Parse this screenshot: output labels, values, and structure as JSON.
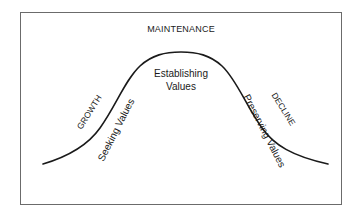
{
  "diagram": {
    "type": "bell-curve-lifecycle",
    "stages": {
      "top": "MAINTENANCE",
      "left": "GROWTH",
      "right": "DECLINE"
    },
    "phases": {
      "peak_line1": "Establishing",
      "peak_line2": "Values",
      "rising": "Seeking Values",
      "falling": "Preserving Values"
    },
    "colors": {
      "curve": "#1a1a1a",
      "frame": "#6b6b6b",
      "text": "#1a1a1a",
      "background": "#ffffff"
    }
  }
}
